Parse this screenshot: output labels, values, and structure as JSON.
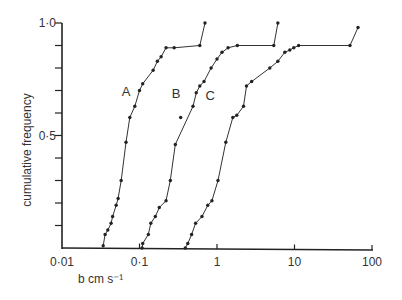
{
  "chart_data": {
    "type": "line",
    "title": "",
    "xlabel": "b  cm s⁻¹",
    "ylabel": "cumulative frequency",
    "xscale": "log",
    "xlim": [
      0.01,
      100
    ],
    "ylim": [
      0,
      1.0
    ],
    "x_ticks": [
      0.01,
      0.1,
      1,
      10,
      100
    ],
    "x_tick_labels": [
      "0·01",
      "0·1",
      "1",
      "10",
      "100"
    ],
    "y_ticks": [
      0,
      0.1,
      0.2,
      0.3,
      0.4,
      0.5,
      0.6,
      0.7,
      0.8,
      0.9,
      1.0
    ],
    "y_tick_labels": {
      "0.5": "0·5",
      "1.0": "1·0"
    },
    "grid": false,
    "legend": "inline curve labels",
    "series": [
      {
        "name": "A",
        "label_pos": {
          "x": 0.075,
          "y": 0.7
        },
        "x": [
          0.034,
          0.036,
          0.039,
          0.043,
          0.045,
          0.05,
          0.053,
          0.058,
          0.067,
          0.075,
          0.087,
          0.1,
          0.11,
          0.15,
          0.17,
          0.19,
          0.22,
          0.28,
          0.6,
          0.7
        ],
        "y": [
          0.01,
          0.06,
          0.08,
          0.11,
          0.14,
          0.19,
          0.22,
          0.3,
          0.47,
          0.58,
          0.63,
          0.7,
          0.73,
          0.79,
          0.83,
          0.85,
          0.89,
          0.89,
          0.9,
          1.0
        ]
      },
      {
        "name": "B",
        "label_pos": {
          "x": 0.33,
          "y": 0.69
        },
        "x": [
          0.108,
          0.11,
          0.13,
          0.14,
          0.16,
          0.18,
          0.22,
          0.25,
          0.29,
          0.49,
          0.54,
          0.6,
          0.68,
          0.84,
          1.0,
          1.16,
          1.39,
          1.83,
          5.4,
          6.1
        ],
        "y": [
          0.0,
          0.02,
          0.06,
          0.11,
          0.14,
          0.18,
          0.21,
          0.3,
          0.46,
          0.63,
          0.69,
          0.72,
          0.74,
          0.8,
          0.84,
          0.87,
          0.89,
          0.9,
          0.9,
          1.0
        ],
        "outliers": [
          {
            "x": 0.34,
            "y": 0.58
          }
        ]
      },
      {
        "name": "C",
        "label_pos": {
          "x": 0.9,
          "y": 0.68
        },
        "x": [
          0.39,
          0.42,
          0.47,
          0.53,
          0.64,
          0.76,
          0.86,
          1.03,
          1.3,
          1.6,
          1.8,
          2.2,
          2.4,
          2.8,
          4.8,
          6.1,
          7.5,
          8.7,
          9.8,
          11.3,
          52,
          66
        ],
        "y": [
          0.0,
          0.02,
          0.06,
          0.11,
          0.14,
          0.19,
          0.21,
          0.3,
          0.47,
          0.58,
          0.59,
          0.63,
          0.72,
          0.74,
          0.8,
          0.83,
          0.87,
          0.88,
          0.89,
          0.9,
          0.9,
          0.98
        ]
      }
    ]
  },
  "layout_map": {
    "x_origin_px": 62,
    "px_per_decade": 77.5,
    "x_min_log": -2,
    "y_zero_px": 248,
    "y_one_px": 23
  }
}
